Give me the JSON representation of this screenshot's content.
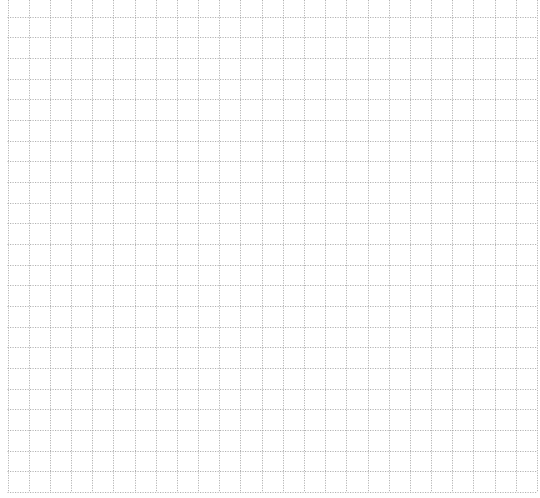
{
  "page": {
    "type": "grid-paper",
    "background_color": "#ffffff",
    "line_color": "#9a9a9a",
    "line_style": "dotted",
    "columns": 25,
    "rows": 23
  }
}
